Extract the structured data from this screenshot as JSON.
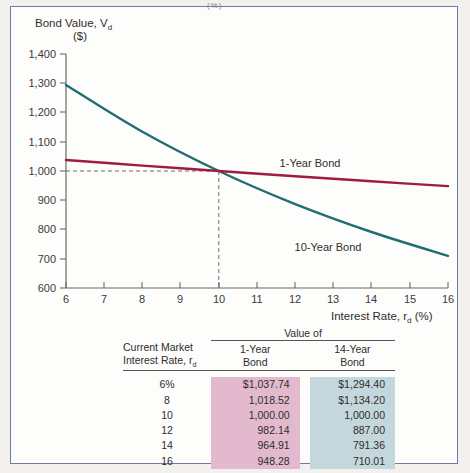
{
  "figure": {
    "background_color": "#fdfdfb",
    "border_color": "#6d7ba6",
    "top_cut_text": "(%)"
  },
  "chart_data": {
    "type": "line",
    "title": "",
    "xlabel": "Interest Rate, r",
    "xlabel_sub": "d",
    "xlabel_unit": " (%)",
    "ylabel_line1": "Bond Value, V",
    "ylabel_sub": "d",
    "ylabel_line2": "($)",
    "xlim": [
      6,
      16
    ],
    "ylim": [
      600,
      1400
    ],
    "xticks": [
      6,
      7,
      8,
      9,
      10,
      11,
      12,
      13,
      14,
      15,
      16
    ],
    "xticklabels": [
      "6",
      "7",
      "8",
      "9",
      "10",
      "11",
      "12",
      "13",
      "14",
      "15",
      "16"
    ],
    "yticks": [
      600,
      700,
      800,
      900,
      1000,
      1100,
      1200,
      1300,
      1400
    ],
    "yticklabels": [
      "600",
      "700",
      "800",
      "900",
      "1,000",
      "1,100",
      "1,200",
      "1,300",
      "1,400"
    ],
    "grid": false,
    "legend_position": "inline-annotations",
    "annotations": [
      {
        "text": "1-Year Bond",
        "x": 12.0,
        "y": 1085,
        "color": "#2e2e2e"
      },
      {
        "text": "10-Year Bond",
        "x": 12.6,
        "y": 790,
        "color": "#2e2e2e"
      }
    ],
    "reference_lines": {
      "horizontal_value": 1000,
      "vertical_value": 10,
      "style": "dashed",
      "color": "#6b6b6b"
    },
    "series": [
      {
        "name": "1-Year Bond",
        "color": "#9e1b41",
        "x": [
          6,
          8,
          10,
          12,
          14,
          16
        ],
        "values": [
          1037.74,
          1018.52,
          1000.0,
          982.14,
          964.91,
          948.28
        ]
      },
      {
        "name": "10-Year Bond",
        "color": "#1f6e72",
        "x": [
          6,
          8,
          10,
          12,
          14,
          16
        ],
        "values": [
          1294.4,
          1134.2,
          1000.0,
          887.0,
          791.36,
          710.01
        ]
      }
    ]
  },
  "table": {
    "group_header": "Value of",
    "col_headers": {
      "rate_line1": "Current Market",
      "rate_line2": "Interest Rate, r",
      "rate_sub": "d",
      "col1_line1": "1-Year",
      "col1_line2": "Bond",
      "col2_line1": "14-Year",
      "col2_line2": "Bond"
    },
    "highlight_colors": {
      "col1": "#e3b9cd",
      "col2": "#c3d7dc"
    },
    "rows": [
      {
        "rate": "6%",
        "one_year": "$1,037.74",
        "fourteen_year": "$1,294.40"
      },
      {
        "rate": "8",
        "one_year": "1,018.52",
        "fourteen_year": "$1,134.20"
      },
      {
        "rate": "10",
        "one_year": "1,000.00",
        "fourteen_year": "1,000.00"
      },
      {
        "rate": "12",
        "one_year": "982.14",
        "fourteen_year": "887.00"
      },
      {
        "rate": "14",
        "one_year": "964.91",
        "fourteen_year": "791.36"
      },
      {
        "rate": "16",
        "one_year": "948.28",
        "fourteen_year": "710.01"
      }
    ]
  }
}
